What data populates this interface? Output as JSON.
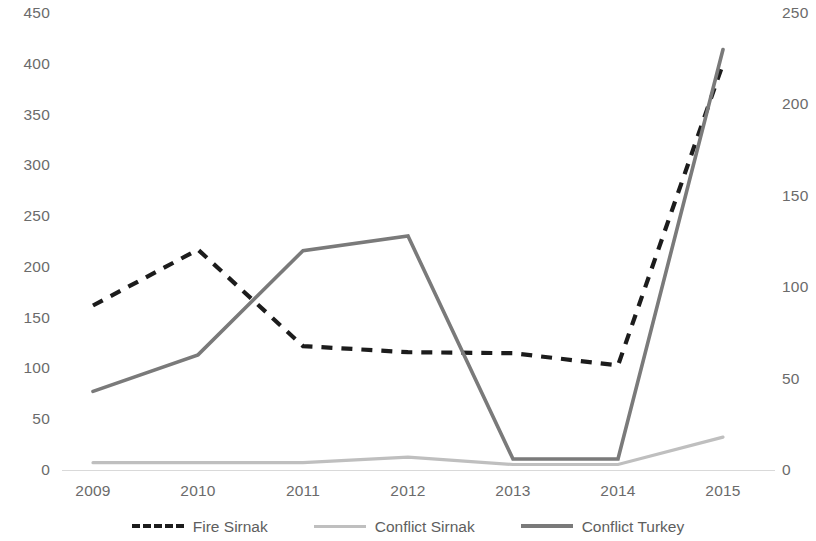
{
  "chart_data": {
    "type": "line",
    "title": "",
    "xlabel": "",
    "ylabel": "",
    "categories": [
      "2009",
      "2010",
      "2011",
      "2012",
      "2013",
      "2014",
      "2015"
    ],
    "x": [
      2009,
      2010,
      2011,
      2012,
      2013,
      2014,
      2015
    ],
    "grid": false,
    "legend_position": "bottom",
    "axes": {
      "left": {
        "ylim": [
          0,
          450
        ],
        "ticks": [
          0,
          50,
          100,
          150,
          200,
          250,
          300,
          350,
          400,
          450
        ],
        "tick_labels": [
          "0",
          "50",
          "100",
          "150",
          "200",
          "250",
          "300",
          "350",
          "400",
          "450"
        ]
      },
      "right": {
        "ylim": [
          0,
          250
        ],
        "ticks": [
          0,
          50,
          100,
          150,
          200,
          250
        ],
        "tick_labels": [
          "0",
          "50",
          "100",
          "150",
          "200",
          "250"
        ]
      }
    },
    "series": [
      {
        "name": "Fire Sirnak",
        "axis": "left",
        "style": "dashed",
        "color": "#1c1c1c",
        "values": [
          162,
          217,
          122,
          116,
          115,
          103,
          400
        ]
      },
      {
        "name": "Conflict Sirnak",
        "axis": "right",
        "style": "solid",
        "color": "#bfbfbf",
        "values": [
          4,
          4,
          4,
          7,
          3,
          3,
          18
        ]
      },
      {
        "name": "Conflict Turkey",
        "axis": "right",
        "style": "solid",
        "color": "#7a7a7a",
        "values": [
          43,
          63,
          120,
          128,
          6,
          6,
          230
        ]
      }
    ]
  },
  "legend": {
    "items": [
      {
        "label": "Fire Sirnak"
      },
      {
        "label": "Conflict Sirnak"
      },
      {
        "label": "Conflict Turkey"
      }
    ]
  }
}
